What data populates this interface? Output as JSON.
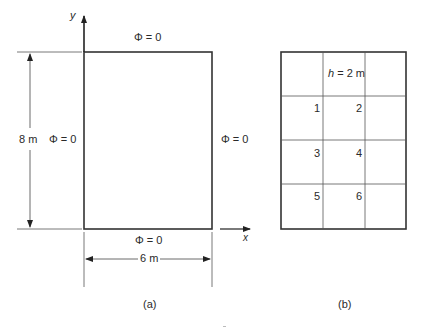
{
  "figure_a": {
    "caption": "(a)",
    "axis_y": "y",
    "axis_x": "x",
    "bc_top": "Φ = 0",
    "bc_left": "Φ = 0",
    "bc_right": "Φ = 0",
    "bc_bottom": "Φ = 0",
    "height_dim": "8 m",
    "width_dim": "6 m"
  },
  "figure_b": {
    "caption": "(b)",
    "grid_spacing": "h = 2 m",
    "grid_spacing_var": "h",
    "grid_spacing_val": " = 2 m",
    "columns": 3,
    "rows": 4,
    "nodes": [
      "1",
      "2",
      "3",
      "4",
      "5",
      "6"
    ]
  }
}
